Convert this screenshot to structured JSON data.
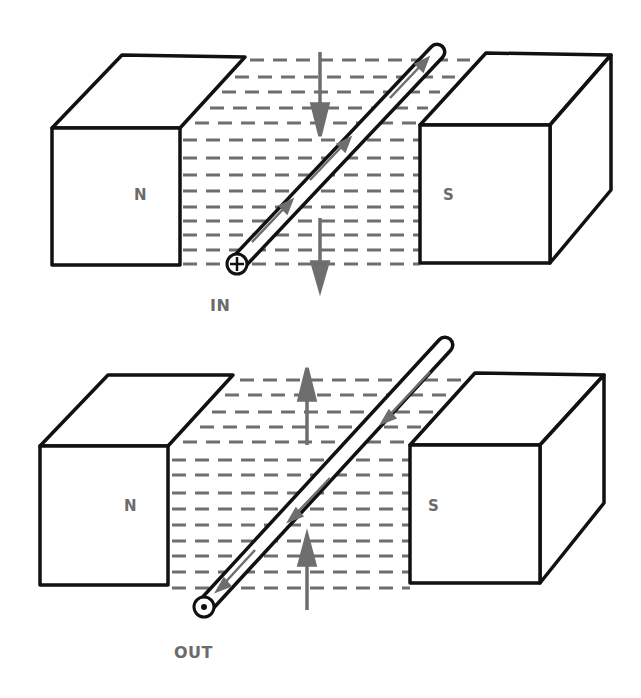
{
  "colors": {
    "outline": "#111111",
    "field": "#6e6e6e",
    "label": "#6b6b6b",
    "background": "#ffffff"
  },
  "panels": [
    {
      "id": "top",
      "current_direction_label": "IN",
      "current_symbol": "cross-in-circle",
      "left_magnet_pole": "N",
      "right_magnet_pole": "S",
      "force_arrow_direction": "down",
      "wire_current_arrow_direction": "up-right"
    },
    {
      "id": "bottom",
      "current_direction_label": "OUT",
      "current_symbol": "dot-in-circle",
      "left_magnet_pole": "N",
      "right_magnet_pole": "S",
      "force_arrow_direction": "up",
      "wire_current_arrow_direction": "down-left"
    }
  ]
}
